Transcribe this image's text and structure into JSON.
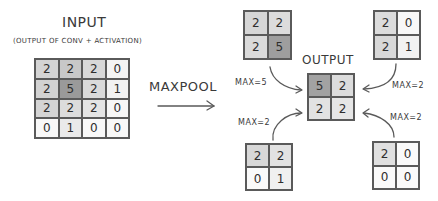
{
  "input": {
    "title": "INPUT",
    "subtitle": "(OUTPUT OF CONV + ACTIVATION)",
    "matrix": [
      [
        "2",
        "2",
        "2",
        "0"
      ],
      [
        "2",
        "5",
        "2",
        "1"
      ],
      [
        "2",
        "2",
        "2",
        "0"
      ],
      [
        "0",
        "1",
        "0",
        "0"
      ]
    ],
    "shades": [
      [
        "#d4d4d4",
        "#c8c8c8",
        "#d8d8d8",
        "#f4f4f4"
      ],
      [
        "#d2d2d2",
        "#9a9a9a",
        "#dadada",
        "#f2f2f2"
      ],
      [
        "#d4d4d4",
        "#dcdcdc",
        "#e4e4e4",
        "#f6f6f6"
      ],
      [
        "#f8f8f8",
        "#eaeaea",
        "#f8f8f8",
        "#f8f8f8"
      ]
    ]
  },
  "operation": {
    "label": "MAXPOOL",
    "arrow_icon": "right-arrow-icon"
  },
  "output": {
    "title": "OUTPUT",
    "matrix": [
      [
        "5",
        "2"
      ],
      [
        "2",
        "2"
      ]
    ],
    "shades": [
      [
        "#a2a2a2",
        "#dcdcdc"
      ],
      [
        "#e2e2e2",
        "#e6e6e6"
      ]
    ]
  },
  "windows": [
    {
      "position": "top-left",
      "matrix": [
        [
          "2",
          "2"
        ],
        [
          "2",
          "5"
        ]
      ],
      "shades": [
        [
          "#d6d6d6",
          "#dcdcdc"
        ],
        [
          "#dadada",
          "#9e9e9e"
        ]
      ],
      "max_label": "MAX=5"
    },
    {
      "position": "top-right",
      "matrix": [
        [
          "2",
          "0"
        ],
        [
          "2",
          "1"
        ]
      ],
      "shades": [
        [
          "#dcdcdc",
          "#f8f8f8"
        ],
        [
          "#d8d8d8",
          "#f2f2f2"
        ]
      ],
      "max_label": "MAX=2"
    },
    {
      "position": "bottom-left",
      "matrix": [
        [
          "2",
          "2"
        ],
        [
          "0",
          "1"
        ]
      ],
      "shades": [
        [
          "#d8d8d8",
          "#e2e2e2"
        ],
        [
          "#fafafa",
          "#f0f0f0"
        ]
      ],
      "max_label": "MAX=2"
    },
    {
      "position": "bottom-right",
      "matrix": [
        [
          "2",
          "0"
        ],
        [
          "0",
          "0"
        ]
      ],
      "shades": [
        [
          "#e0e0e0",
          "#fafafa"
        ],
        [
          "#fafafa",
          "#fafafa"
        ]
      ],
      "max_label": "MAX=2"
    }
  ],
  "colors": {
    "line": "#5a5a5a",
    "text": "#333333",
    "background": "#ffffff"
  }
}
